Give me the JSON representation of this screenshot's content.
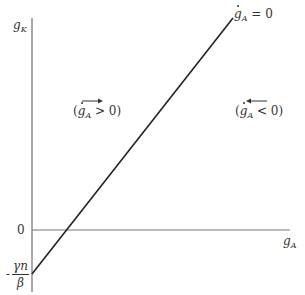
{
  "diagram": {
    "y_axis_label": {
      "base": "g",
      "sub": "K"
    },
    "x_axis_label": {
      "base": "g",
      "sub": "A"
    },
    "origin_label": "0",
    "intercept_label": {
      "sign": "-",
      "numerator": "γn",
      "denominator": "β"
    },
    "line_label": {
      "base": "g",
      "sub": "A",
      "rhs": " = 0"
    },
    "region_left": {
      "base": "g",
      "sub": "A",
      "relation": " > 0",
      "arrow": "right"
    },
    "region_right": {
      "base": "g",
      "sub": "A",
      "relation": " < 0",
      "arrow": "left"
    },
    "colors": {
      "axis": "#555555",
      "line": "#222222",
      "text": "#333333"
    }
  }
}
